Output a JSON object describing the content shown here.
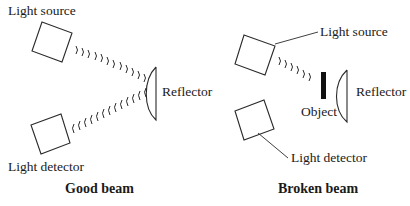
{
  "good_beam": {
    "caption": "Good beam",
    "light_source_label": "Light source",
    "reflector_label": "Reflector",
    "light_detector_label": "Light detector",
    "outgoing_wave_count": 12,
    "return_wave_count": 11
  },
  "broken_beam": {
    "caption": "Broken beam",
    "light_source_label": "Light source",
    "object_label": "Object",
    "reflector_label": "Reflector",
    "light_detector_label": "Light detector",
    "outgoing_wave_count": 6
  },
  "colors": {
    "line": "#2a2a2a",
    "object_fill": "#111111",
    "background": "#ffffff"
  }
}
